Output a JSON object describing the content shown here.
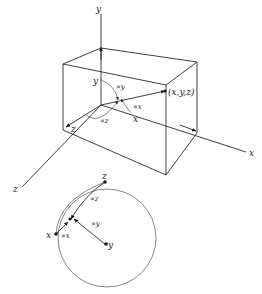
{
  "diagram": {
    "axes": {
      "x": "x",
      "y": "y",
      "z": "z"
    },
    "point_label": "(x,y,z)",
    "box_labels": {
      "x": "x",
      "y": "y",
      "z": "z"
    },
    "angles": {
      "alpha_x": "∝x",
      "alpha_y": "∝y",
      "alpha_z": "∝z"
    },
    "sphere": {
      "points": {
        "x": "x",
        "y": "y",
        "z": "z"
      },
      "angles": {
        "alpha_x": "∝x",
        "alpha_y": "∝y",
        "alpha_z": "∝z"
      }
    }
  }
}
